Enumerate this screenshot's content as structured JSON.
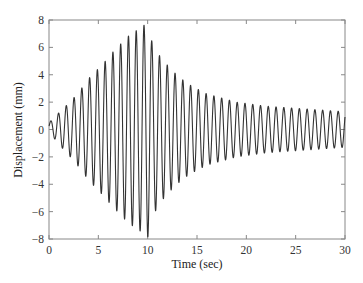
{
  "chart_data": {
    "type": "line",
    "title": "",
    "xlabel": "Time (sec)",
    "ylabel": "Displacement (mm)",
    "xlim": [
      0,
      30
    ],
    "ylim": [
      -8,
      8
    ],
    "xticks": [
      0,
      5,
      10,
      15,
      20,
      25,
      30
    ],
    "yticks": [
      -8,
      -6,
      -4,
      -2,
      0,
      2,
      4,
      6,
      8
    ],
    "grid": false,
    "legend": null,
    "series": [
      {
        "name": "Displacement",
        "color": "#333333",
        "frequency_hz": 1.27,
        "envelope": {
          "t": [
            0,
            0.8,
            1.6,
            2.4,
            3.2,
            4.0,
            4.8,
            5.6,
            6.4,
            7.2,
            8.0,
            8.8,
            9.6,
            10.0,
            10.4,
            11.2,
            12.0,
            12.8,
            13.6,
            14.4,
            15.2,
            16.0,
            17.0,
            18.0,
            19.0,
            20.0,
            21.0,
            22.0,
            23.0,
            24.0,
            25.0,
            26.0,
            27.0,
            28.0,
            29.0,
            30.0
          ],
          "amplitude": [
            0.3,
            1.0,
            1.6,
            2.2,
            2.9,
            3.7,
            4.3,
            4.9,
            5.6,
            6.2,
            6.8,
            7.2,
            7.6,
            7.9,
            6.5,
            5.4,
            4.7,
            4.1,
            3.6,
            3.2,
            2.9,
            2.6,
            2.4,
            2.2,
            2.0,
            1.9,
            1.8,
            1.7,
            1.65,
            1.6,
            1.55,
            1.5,
            1.45,
            1.4,
            1.35,
            1.3
          ]
        },
        "offset_mm": 0.2,
        "start_value": 0.2,
        "end_value": -0.6
      }
    ]
  }
}
